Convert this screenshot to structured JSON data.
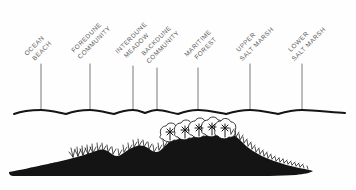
{
  "diagram": {
    "background_color": "#fefefe",
    "ink_color": "#141414",
    "label_color": "#5a5a5a",
    "label_rotation_deg": -45,
    "zones": [
      {
        "id": "ocean-beach",
        "line1": "OCEAN",
        "line2": "BEACH",
        "leader_x": 41,
        "label_x": 27,
        "label_y": 56
      },
      {
        "id": "foredune-community",
        "line1": "FOREDUNE",
        "line2": "COMMUNITY",
        "leader_x": 90,
        "label_x": 76,
        "label_y": 56
      },
      {
        "id": "interdune-meadow",
        "line1": "INTERDUNE",
        "line2": "MEADOW",
        "leader_x": 133,
        "label_x": 119,
        "label_y": 56
      },
      {
        "id": "backdune-community",
        "line1": "BACKDUNE",
        "line2": "COMMUNITY",
        "leader_x": 157,
        "label_x": 152,
        "label_y": 58
      },
      {
        "id": "maritime-forest",
        "line1": "MARITIME",
        "line2": "FOREST",
        "leader_x": 198,
        "label_x": 190,
        "label_y": 58
      },
      {
        "id": "upper-salt-marsh",
        "line1": "UPPER",
        "line2": "SALT MARSH",
        "leader_x": 250,
        "label_x": 238,
        "label_y": 56
      },
      {
        "id": "lower-salt-marsh",
        "line1": "LOWER",
        "line2": "SALT MARSH",
        "leader_x": 302,
        "label_x": 290,
        "label_y": 56
      }
    ],
    "bracket": {
      "baseline_y": 112,
      "start_x": 14,
      "end_x": 345,
      "cusp_depth": 4
    },
    "leader": {
      "top_y": 64,
      "bottom_y": 110
    },
    "terrain": {
      "description": "Black silhouette cross-section of a barrier island: low beach at left rising to a grass-tufted foredune, an interdune swale, a backdune rise, a maritime forest crest of rounded trees, then tapering salt marsh to the right.",
      "forest_tree_count": 7,
      "baseline_y": 176
    }
  }
}
